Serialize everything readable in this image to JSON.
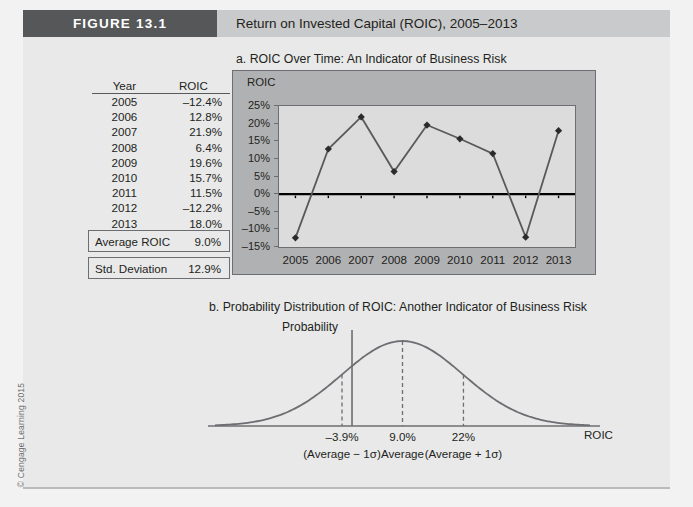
{
  "header": {
    "figure_tag": "FIGURE 13.1",
    "title": "Return on Invested Capital (ROIC), 2005–2013"
  },
  "copyright": "© Cengage Learning 2015",
  "captions": {
    "a": "a. ROIC Over Time: An Indicator of Business Risk",
    "b": "b. Probability Distribution of ROIC: Another Indicator of Business Risk"
  },
  "table": {
    "headers": [
      "Year",
      "ROIC"
    ],
    "rows": [
      {
        "year": "2005",
        "roic": "–12.4%"
      },
      {
        "year": "2006",
        "roic": "12.8%"
      },
      {
        "year": "2007",
        "roic": "21.9%"
      },
      {
        "year": "2008",
        "roic": "6.4%"
      },
      {
        "year": "2009",
        "roic": "19.6%"
      },
      {
        "year": "2010",
        "roic": "15.7%"
      },
      {
        "year": "2011",
        "roic": "11.5%"
      },
      {
        "year": "2012",
        "roic": "–12.2%"
      },
      {
        "year": "2013",
        "roic": "18.0%"
      }
    ],
    "summary": [
      {
        "label": "Average ROIC",
        "value": "9.0%"
      },
      {
        "label": "Std. Deviation",
        "value": "12.9%"
      }
    ]
  },
  "chart_data": [
    {
      "type": "line",
      "title": "a. ROIC Over Time: An Indicator of Business Risk",
      "xlabel": "",
      "ylabel": "ROIC",
      "categories": [
        "2005",
        "2006",
        "2007",
        "2008",
        "2009",
        "2010",
        "2011",
        "2012",
        "2013"
      ],
      "values": [
        -12.4,
        12.8,
        21.9,
        6.4,
        19.6,
        15.7,
        11.5,
        -12.2,
        18.0
      ],
      "ylim": [
        -15,
        25
      ],
      "ytick_labels": [
        "25%",
        "20%",
        "15%",
        "10%",
        "5%",
        "0%",
        "–5%",
        "–10%",
        "–15%"
      ],
      "ytick_values": [
        25,
        20,
        15,
        10,
        5,
        0,
        -5,
        -10,
        -15
      ],
      "grid": false,
      "legend": "none",
      "marker": "diamond",
      "zero_line": true,
      "series_color": "#58595b",
      "plot_bg": "#dcdcdd",
      "panel_bg": "#b0b1b3"
    },
    {
      "type": "line",
      "title": "b. Probability Distribution of ROIC: Another Indicator of Business Risk",
      "subtype": "normal-distribution",
      "ylabel": "Probability",
      "xlabel": "ROIC",
      "mean": 9.0,
      "std_dev": 12.9,
      "markers": [
        {
          "x": -3.9,
          "label": "–3.9%",
          "sub": "(Average − 1σ)",
          "style": "dashed"
        },
        {
          "x": 9.0,
          "label": "9.0%",
          "sub": "Average",
          "style": "dashed"
        },
        {
          "x": 22.0,
          "label": "22%",
          "sub": "(Average + 1σ)",
          "style": "dashed"
        }
      ],
      "curve_color": "#6d6e71",
      "grid": false,
      "legend": "none"
    }
  ],
  "colors": {
    "tag_bg": "#565759",
    "header_bg": "#c9cacb",
    "panel_bg": "#e9e9ea",
    "ink": "#231f20",
    "line": "#58595b"
  }
}
